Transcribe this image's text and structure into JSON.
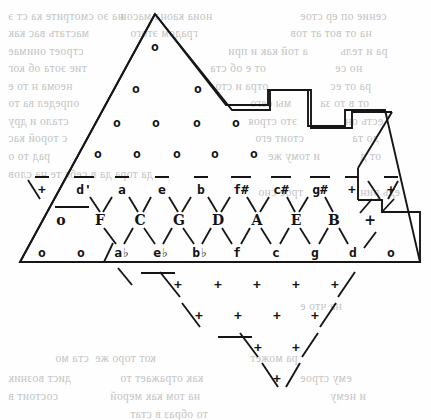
{
  "document": {
    "type": "scanned-book-page",
    "figure": "tonnetz-lattice-diagram",
    "background_color": "#ffffff",
    "ink_color": "#131313",
    "bleed_color": "#b9b9b9"
  },
  "figure": {
    "caption": "",
    "boundary_name": "lattice-boundary-outline",
    "rows": {
      "circles_row_1": {
        "symbol": "o",
        "count": 1,
        "y": 46,
        "xs": [
          155
        ]
      },
      "circles_row_2": {
        "symbol": "o",
        "count": 2,
        "y": 88,
        "xs": [
          136,
          198
        ]
      },
      "circles_row_3": {
        "symbol": "o",
        "count": 4,
        "y": 122,
        "xs": [
          117,
          156,
          197,
          236
        ]
      },
      "circles_row_4": {
        "symbol": "o",
        "count": 5,
        "y": 153,
        "xs": [
          98,
          137,
          177,
          215,
          254
        ]
      },
      "sharps_row": {
        "y": 189,
        "items": [
          {
            "text": "+",
            "x": 42,
            "overline": true
          },
          {
            "text": "d'",
            "x": 84,
            "overline": true
          },
          {
            "text": "a",
            "x": 122,
            "overline": true
          },
          {
            "text": "e",
            "x": 162,
            "overline": true
          },
          {
            "text": "b",
            "x": 201,
            "overline": true
          },
          {
            "text": "f#",
            "x": 241,
            "overline": true
          },
          {
            "text": "c#",
            "x": 281,
            "overline": true
          },
          {
            "text": "g#",
            "x": 320,
            "overline": true
          },
          {
            "text": "+",
            "x": 352,
            "overline": true
          },
          {
            "text": "+",
            "x": 391,
            "overline": true
          }
        ]
      },
      "naturals_row": {
        "y": 220,
        "items": [
          {
            "text": "o",
            "x": 61
          },
          {
            "text": "F",
            "x": 100
          },
          {
            "text": "C",
            "x": 140
          },
          {
            "text": "G",
            "x": 179
          },
          {
            "text": "D",
            "x": 218
          },
          {
            "text": "A",
            "x": 257
          },
          {
            "text": "E",
            "x": 296
          },
          {
            "text": "B",
            "x": 334
          },
          {
            "text": "+",
            "x": 370
          }
        ]
      },
      "flats_row": {
        "y": 252,
        "items": [
          {
            "text": "o",
            "x": 42
          },
          {
            "text": "o",
            "x": 81
          },
          {
            "text": "ab",
            "x": 122,
            "flat": true
          },
          {
            "text": "eb",
            "x": 161,
            "flat": true
          },
          {
            "text": "bb",
            "x": 200,
            "flat": true
          },
          {
            "text": "f",
            "x": 237
          },
          {
            "text": "c",
            "x": 276
          },
          {
            "text": "g",
            "x": 315
          },
          {
            "text": "d",
            "x": 353
          },
          {
            "text": "o",
            "x": 391
          }
        ]
      },
      "plus_row_1": {
        "symbol": "+",
        "count": 5,
        "y": 284,
        "xs": [
          178,
          218,
          257,
          296,
          335
        ]
      },
      "plus_row_2": {
        "symbol": "+",
        "count": 4,
        "y": 315,
        "xs": [
          199,
          238,
          277,
          315
        ]
      },
      "plus_row_3": {
        "symbol": "+",
        "count": 2,
        "y": 347,
        "xs": [
          258,
          296
        ]
      },
      "plus_row_4": {
        "symbol": "+",
        "count": 1,
        "y": 378,
        "xs": [
          277
        ]
      }
    },
    "underlines": [
      {
        "name": "underline-left",
        "x": 55,
        "y": 206,
        "w": 34
      },
      {
        "name": "underline-lower",
        "x": 141,
        "y": 272,
        "w": 34
      },
      {
        "name": "underline-lowest",
        "x": 218,
        "y": 336,
        "w": 34
      }
    ]
  },
  "bleed_text": {
    "note": "faint mirrored show-through from the reverse side of the scanned sheet",
    "lines": [
      {
        "text": "на эо смотрите ка ст э",
        "x": 8,
        "y": 10,
        "mirrored": true
      },
      {
        "text": "ноиа каона масои",
        "x": 120,
        "y": 10,
        "mirrored": true
      },
      {
        "text": "сение оп ер стое",
        "x": 300,
        "y": 10,
        "mirrored": true
      },
      {
        "text": "мастать вас как",
        "x": 8,
        "y": 27,
        "mirrored": true
      },
      {
        "text": "градом этого",
        "x": 130,
        "y": 27,
        "mirrored": true
      },
      {
        "text": "на от вот ат тов",
        "x": 290,
        "y": 27,
        "mirrored": true
      },
      {
        "text": "строет онимае",
        "x": 8,
        "y": 45,
        "mirrored": true
      },
      {
        "text": "а той как и при",
        "x": 228,
        "y": 45,
        "mirrored": true
      },
      {
        "text": "ра и тель",
        "x": 340,
        "y": 45,
        "mirrored": true
      },
      {
        "text": "тие эота об ког",
        "x": 8,
        "y": 62,
        "mirrored": true
      },
      {
        "text": "от е об ста",
        "x": 210,
        "y": 62,
        "mirrored": true
      },
      {
        "text": "но се",
        "x": 335,
        "y": 62,
        "mirrored": true
      },
      {
        "text": "неома н то е",
        "x": 8,
        "y": 80,
        "mirrored": true
      },
      {
        "text": "отра и сто",
        "x": 215,
        "y": 80,
        "mirrored": true
      },
      {
        "text": "ра от ес",
        "x": 330,
        "y": 80,
        "mirrored": true
      },
      {
        "text": "определ ва то",
        "x": 8,
        "y": 97,
        "mirrored": true
      },
      {
        "text": "мы сего",
        "x": 250,
        "y": 97,
        "mirrored": true
      },
      {
        "text": "от в то за",
        "x": 320,
        "y": 97,
        "mirrored": true
      },
      {
        "text": "стало и дру",
        "x": 8,
        "y": 115,
        "mirrored": true
      },
      {
        "text": "это строя",
        "x": 248,
        "y": 115,
        "mirrored": true
      },
      {
        "text": "есть он",
        "x": 345,
        "y": 115,
        "mirrored": true
      },
      {
        "text": "с торой кас",
        "x": 8,
        "y": 132,
        "mirrored": true
      },
      {
        "text": "стоит его",
        "x": 255,
        "y": 132,
        "mirrored": true
      },
      {
        "text": "до та",
        "x": 352,
        "y": 132,
        "mirrored": true
      },
      {
        "text": "рад то о",
        "x": 8,
        "y": 150,
        "mirrored": true
      },
      {
        "text": "и тому же",
        "x": 268,
        "y": 150,
        "mirrored": true
      },
      {
        "text": "от д",
        "x": 360,
        "y": 150,
        "mirrored": true
      },
      {
        "text": "да тора да в себя те на слов",
        "x": 8,
        "y": 168,
        "mirrored": true
      },
      {
        "text": "трое сно",
        "x": 258,
        "y": 186,
        "mirrored": true
      },
      {
        "text": "едь рин",
        "x": 360,
        "y": 186,
        "mirrored": true
      },
      {
        "text": "на что е",
        "x": 300,
        "y": 300,
        "mirrored": true
      },
      {
        "text": "ста мо",
        "x": 55,
        "y": 352,
        "mirrored": true
      },
      {
        "text": "кот торо же",
        "x": 95,
        "y": 352,
        "mirrored": true
      },
      {
        "text": "ра может",
        "x": 250,
        "y": 352,
        "mirrored": true
      },
      {
        "text": "дист возник",
        "x": 8,
        "y": 372,
        "mirrored": true
      },
      {
        "text": "как отражает то",
        "x": 120,
        "y": 372,
        "mirrored": true
      },
      {
        "text": "ему строе",
        "x": 300,
        "y": 372,
        "mirrored": true
      },
      {
        "text": "состоит в",
        "x": 8,
        "y": 390,
        "mirrored": true
      },
      {
        "text": "на том как мерой",
        "x": 110,
        "y": 390,
        "mirrored": true
      },
      {
        "text": "и нему",
        "x": 330,
        "y": 390,
        "mirrored": true
      },
      {
        "text": "то образ в стат",
        "x": 130,
        "y": 408,
        "mirrored": true
      }
    ]
  }
}
